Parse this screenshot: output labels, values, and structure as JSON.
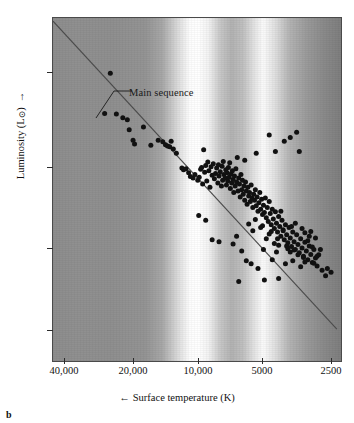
{
  "figure": {
    "panel_letter": "b",
    "annotation": {
      "text": "Main sequence"
    }
  },
  "axes": {
    "y": {
      "title": "Luminosity (L",
      "title_symbol": "⊙",
      "title_close": ")",
      "arrow": "→",
      "ticks": [
        {
          "label_base": "10",
          "label_exp": "4",
          "value": 10000,
          "y_px": 72
        },
        {
          "label_base": "10",
          "label_exp": "2",
          "value": 100,
          "y_px": 167
        },
        {
          "label_base": "1",
          "label_exp": "",
          "value": 1,
          "y_px": 248
        },
        {
          "label_base": "10",
          "label_exp": "−2",
          "value": 0.01,
          "y_px": 330
        }
      ]
    },
    "x": {
      "title": "Surface temperature (K)",
      "arrow": "←",
      "ticks": [
        {
          "label": "40,000",
          "value": 40000,
          "x_px": 64
        },
        {
          "label": "20,000",
          "value": 20000,
          "x_px": 133
        },
        {
          "label": "10,000",
          "value": 10000,
          "x_px": 198
        },
        {
          "label": "5000",
          "value": 5000,
          "x_px": 262
        },
        {
          "label": "2500",
          "value": 2500,
          "x_px": 331
        }
      ]
    }
  },
  "colors": {
    "dot": "#111111",
    "line": "#4b4b4b",
    "frame": "#4a4a4a",
    "text": "#111111"
  },
  "chart_data": {
    "type": "scatter",
    "title": "",
    "subtitle": "",
    "xlabel": "Surface temperature (K)",
    "ylabel": "Luminosity (L⊙)",
    "xscale": "log",
    "yscale": "log",
    "x_reversed": true,
    "xlim": [
      45000,
      2300
    ],
    "ylim": [
      0.0015,
      120000
    ],
    "grid": false,
    "legend": null,
    "annotations": [
      {
        "text": "Main sequence",
        "x": 13000,
        "y": 900,
        "points_to": {
          "x": 23000,
          "y": 2000
        }
      }
    ],
    "series": [
      {
        "name": "Main sequence fit line",
        "type": "line",
        "x": [
          47000,
          2450
        ],
        "y": [
          130000,
          0.009
        ]
      },
      {
        "name": "Stars",
        "type": "scatter",
        "marker": "filled circle",
        "n_points": 204,
        "points": [
          [
            25000,
            6500
          ],
          [
            26500,
            780
          ],
          [
            23500,
            760
          ],
          [
            22000,
            620
          ],
          [
            21000,
            560
          ],
          [
            20600,
            330
          ],
          [
            19800,
            190
          ],
          [
            19500,
            155
          ],
          [
            17800,
            380
          ],
          [
            16500,
            145
          ],
          [
            15300,
            190
          ],
          [
            14600,
            175
          ],
          [
            14200,
            150
          ],
          [
            13900,
            140
          ],
          [
            13600,
            135
          ],
          [
            13400,
            180
          ],
          [
            13100,
            120
          ],
          [
            12700,
            96
          ],
          [
            12000,
            44
          ],
          [
            11800,
            40
          ],
          [
            11500,
            42
          ],
          [
            11200,
            34
          ],
          [
            11000,
            28
          ],
          [
            10700,
            26
          ],
          [
            10500,
            31
          ],
          [
            10200,
            23
          ],
          [
            10050,
            27
          ],
          [
            9900,
            41
          ],
          [
            9800,
            45
          ],
          [
            9700,
            19
          ],
          [
            9600,
            115
          ],
          [
            9500,
            35
          ],
          [
            9400,
            50
          ],
          [
            9300,
            22
          ],
          [
            9200,
            60
          ],
          [
            9100,
            38
          ],
          [
            9000,
            16
          ],
          [
            8900,
            47
          ],
          [
            8800,
            30
          ],
          [
            8700,
            55
          ],
          [
            8600,
            25
          ],
          [
            8500,
            33
          ],
          [
            8400,
            44
          ],
          [
            8300,
            20
          ],
          [
            8250,
            52
          ],
          [
            8200,
            29
          ],
          [
            8100,
            36
          ],
          [
            8000,
            17
          ],
          [
            7950,
            48
          ],
          [
            7900,
            23
          ],
          [
            7850,
            62
          ],
          [
            7800,
            31
          ],
          [
            7700,
            26
          ],
          [
            7650,
            40
          ],
          [
            7600,
            18
          ],
          [
            7550,
            34
          ],
          [
            7500,
            22
          ],
          [
            7450,
            45
          ],
          [
            7400,
            27
          ],
          [
            7350,
            58
          ],
          [
            7300,
            15
          ],
          [
            7250,
            32
          ],
          [
            7200,
            20
          ],
          [
            7150,
            38
          ],
          [
            7100,
            24
          ],
          [
            7050,
            12
          ],
          [
            7000,
            29
          ],
          [
            6950,
            17
          ],
          [
            6900,
            42
          ],
          [
            6850,
            21
          ],
          [
            6800,
            76
          ],
          [
            6750,
            13
          ],
          [
            6700,
            26
          ],
          [
            6650,
            19
          ],
          [
            6600,
            9.5
          ],
          [
            6550,
            31
          ],
          [
            6500,
            14
          ],
          [
            6450,
            23
          ],
          [
            6400,
            11
          ],
          [
            6350,
            17
          ],
          [
            6300,
            8
          ],
          [
            6250,
            21
          ],
          [
            6200,
            13
          ],
          [
            6150,
            6.5
          ],
          [
            6100,
            16
          ],
          [
            6050,
            10
          ],
          [
            6000,
            12
          ],
          [
            5950,
            7.5
          ],
          [
            5900,
            18
          ],
          [
            5850,
            9
          ],
          [
            5800,
            5.5
          ],
          [
            5750,
            11
          ],
          [
            5700,
            8
          ],
          [
            5650,
            14
          ],
          [
            5600,
            6
          ],
          [
            5550,
            9.5
          ],
          [
            5500,
            4.5
          ],
          [
            5450,
            7
          ],
          [
            5400,
            12
          ],
          [
            5350,
            5
          ],
          [
            5300,
            8.5
          ],
          [
            5250,
            3.8
          ],
          [
            5200,
            6.2
          ],
          [
            5150,
            4.2
          ],
          [
            5100,
            9
          ],
          [
            5050,
            3.2
          ],
          [
            5000,
            5.5
          ],
          [
            4950,
            2.6
          ],
          [
            4900,
            7.5
          ],
          [
            4850,
            4
          ],
          [
            4800,
            2.2
          ],
          [
            4750,
            5
          ],
          [
            4700,
            3
          ],
          [
            4650,
            1.8
          ],
          [
            4600,
            4.4
          ],
          [
            4550,
            2.4
          ],
          [
            4500,
            1.5
          ],
          [
            4450,
            3.4
          ],
          [
            4400,
            2
          ],
          [
            4350,
            1.2
          ],
          [
            4300,
            2.8
          ],
          [
            4250,
            1.6
          ],
          [
            4200,
            1.0
          ],
          [
            4150,
            2.2
          ],
          [
            4100,
            1.3
          ],
          [
            4050,
            0.85
          ],
          [
            4000,
            1.9
          ],
          [
            3950,
            1.1
          ],
          [
            3900,
            0.7
          ],
          [
            3850,
            1.5
          ],
          [
            3800,
            0.9
          ],
          [
            3750,
            0.6
          ],
          [
            3700,
            1.3
          ],
          [
            3650,
            0.78
          ],
          [
            3600,
            0.5
          ],
          [
            3550,
            1.05
          ],
          [
            3500,
            0.65
          ],
          [
            3450,
            0.42
          ],
          [
            3400,
            0.88
          ],
          [
            3350,
            0.55
          ],
          [
            3300,
            0.35
          ],
          [
            3250,
            0.72
          ],
          [
            3200,
            0.46
          ],
          [
            3150,
            0.3
          ],
          [
            3100,
            0.6
          ],
          [
            3050,
            0.38
          ],
          [
            3000,
            0.25
          ],
          [
            4900,
            250
          ],
          [
            4600,
            105
          ],
          [
            4200,
            180
          ],
          [
            3950,
            220
          ],
          [
            3700,
            290
          ],
          [
            3600,
            105
          ],
          [
            5600,
            96
          ],
          [
            6300,
            66
          ],
          [
            4350,
            4.5
          ],
          [
            3900,
            2.0
          ],
          [
            3400,
            1.45
          ],
          [
            3250,
            1.2
          ],
          [
            2950,
            0.45
          ],
          [
            2850,
            0.2
          ],
          [
            2750,
            0.15
          ],
          [
            2700,
            0.22
          ],
          [
            2600,
            0.18
          ],
          [
            5150,
            0.12
          ],
          [
            4450,
            0.13
          ],
          [
            6700,
            0.11
          ],
          [
            7100,
            0.8
          ],
          [
            6850,
            1.2
          ],
          [
            6500,
            0.55
          ],
          [
            6200,
            0.33
          ],
          [
            5900,
            0.28
          ],
          [
            5500,
            0.22
          ],
          [
            5200,
            0.6
          ],
          [
            4750,
            0.35
          ],
          [
            4550,
            0.52
          ],
          [
            4150,
            0.28
          ],
          [
            3850,
            0.33
          ],
          [
            3550,
            0.24
          ],
          [
            3300,
            0.95
          ],
          [
            3150,
            0.68
          ],
          [
            3000,
            0.42
          ],
          [
            2900,
            0.6
          ],
          [
            9400,
            2.8
          ],
          [
            8800,
            1.0
          ],
          [
            8200,
            0.9
          ],
          [
            10100,
            3.6
          ],
          [
            5050,
            1.05
          ],
          [
            4650,
            0.82
          ],
          [
            4250,
            1.7
          ],
          [
            3950,
            0.52
          ],
          [
            3750,
            2.4
          ],
          [
            3500,
            1.8
          ],
          [
            3200,
            1.55
          ],
          [
            3050,
            1.1
          ],
          [
            4450,
            0.75
          ],
          [
            4050,
            0.62
          ],
          [
            3650,
            0.45
          ],
          [
            3400,
            0.31
          ],
          [
            5800,
            1.6
          ],
          [
            5350,
            1.9
          ],
          [
            4900,
            1.35
          ],
          [
            4500,
            1.05
          ],
          [
            4100,
            0.72
          ],
          [
            3800,
            0.58
          ],
          [
            3450,
            0.39
          ],
          [
            3100,
            0.29
          ],
          [
            6050,
            2.3
          ],
          [
            5650,
            2.9
          ],
          [
            5250,
            2.1
          ],
          [
            4800,
            1.55
          ]
        ]
      }
    ]
  }
}
